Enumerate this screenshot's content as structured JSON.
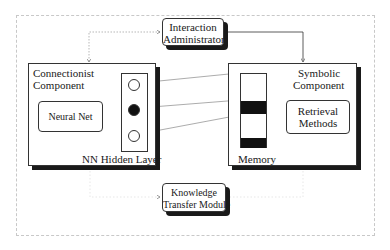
{
  "diagram": {
    "interaction_administrator": {
      "line1": "Interaction",
      "line2": "Administrator"
    },
    "connectionist_component": {
      "title_line1": "Connectionist",
      "title_line2": "Component",
      "neural_net": "Neural Net",
      "hidden_layer_label": "NN Hidden Layer",
      "hidden_nodes": [
        {
          "state": "inactive"
        },
        {
          "state": "active"
        },
        {
          "state": "inactive"
        }
      ]
    },
    "symbolic_component": {
      "title_line1": "Symbolic",
      "title_line2": "Component",
      "memory_label": "Memory",
      "retrieval_line1": "Retrieval",
      "retrieval_line2": "Methods"
    },
    "knowledge_transfer_module": {
      "line1": "Knowledge",
      "line2": "Transfer Module"
    },
    "connections": [
      {
        "from": "Interaction Administrator",
        "to": "Connectionist Component",
        "style": "dotted",
        "bidirectional": true
      },
      {
        "from": "Interaction Administrator",
        "to": "Symbolic Component",
        "style": "solid"
      },
      {
        "from": "Neural Net",
        "to": "NN Hidden Layer",
        "style": "dotted",
        "bidirectional": true
      },
      {
        "from": "Hidden node 1",
        "to": "Memory slot 1",
        "style": "solid"
      },
      {
        "from": "Hidden node 2",
        "to": "Memory slot 2",
        "style": "solid"
      },
      {
        "from": "Hidden node 3",
        "to": "Memory slot 3",
        "style": "solid"
      },
      {
        "from": "Memory",
        "to": "Retrieval Methods",
        "style": "dotted",
        "bidirectional": true
      },
      {
        "from": "Connectionist Component",
        "to": "Knowledge Transfer Module",
        "style": "dotted"
      },
      {
        "from": "Symbolic Component",
        "to": "Knowledge Transfer Module",
        "style": "dotted"
      }
    ]
  }
}
